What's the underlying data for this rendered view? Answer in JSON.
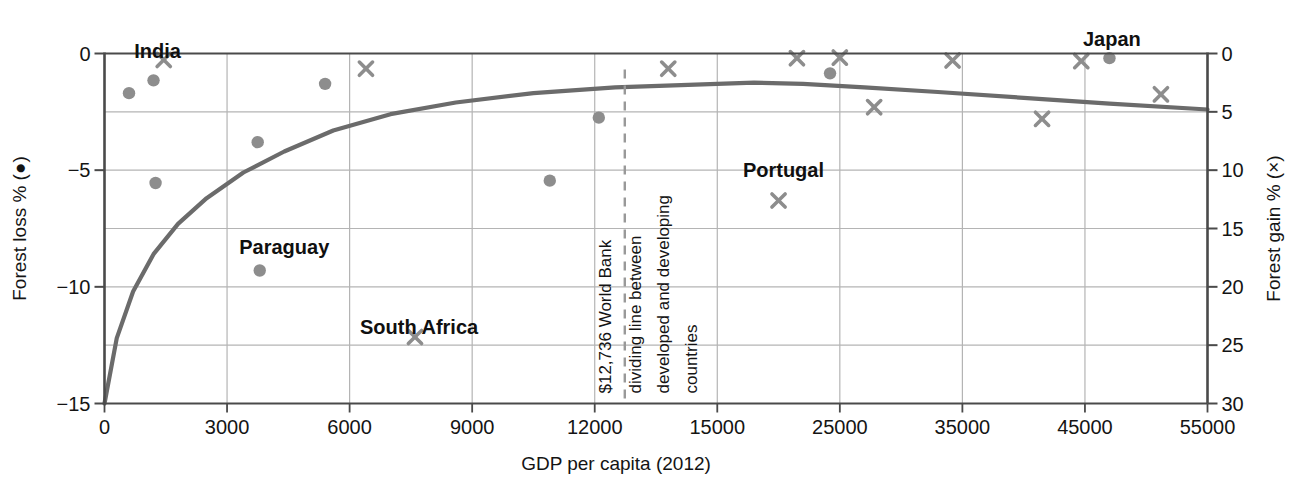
{
  "chart_data": {
    "type": "scatter",
    "title": "",
    "xlabel": "GDP per capita (2012)",
    "ylabel_left": "Forest loss % (●)",
    "ylabel_right": "Forest gain % (×)",
    "xticks": [
      "0",
      "3000",
      "6000",
      "9000",
      "12000",
      "15000",
      "25000",
      "35000",
      "45000",
      "55000"
    ],
    "xtick_values": [
      0,
      3000,
      6000,
      9000,
      12000,
      15000,
      25000,
      35000,
      45000,
      55000
    ],
    "yticks_left": [
      "0",
      "−5",
      "−10",
      "−15"
    ],
    "ytick_values_left": [
      0,
      -5,
      -10,
      -15
    ],
    "yticks_right": [
      "0",
      "5",
      "10",
      "15",
      "20",
      "25",
      "30"
    ],
    "ytick_values_right": [
      0,
      5,
      10,
      15,
      20,
      25,
      30
    ],
    "ylim_left": [
      -15,
      0
    ],
    "ylim_right": [
      30,
      0
    ],
    "grid": true,
    "legend_position": "axis-labels",
    "series": [
      {
        "name": "Forest loss % (●)",
        "marker": "circle",
        "axis": "left",
        "color": "#8d8d8d",
        "points": [
          {
            "x": 600,
            "y": -1.7
          },
          {
            "x": 1200,
            "y": -1.15,
            "label": "India"
          },
          {
            "x": 3750,
            "y": -3.8
          },
          {
            "x": 1250,
            "y": -5.55
          },
          {
            "x": 5400,
            "y": -1.3
          },
          {
            "x": 3800,
            "y": -9.3,
            "label": "Paraguay"
          },
          {
            "x": 12100,
            "y": -2.75
          },
          {
            "x": 10900,
            "y": -5.45
          },
          {
            "x": 24200,
            "y": -0.85
          },
          {
            "x": 47000,
            "y": -0.2,
            "label": "Japan"
          }
        ]
      },
      {
        "name": "Forest gain % (×)",
        "marker": "cross",
        "axis": "right",
        "color": "#8d8d8d",
        "points": [
          {
            "x": 1450,
            "y": 0.55,
            "label": "India"
          },
          {
            "x": 6400,
            "y": 1.3
          },
          {
            "x": 7600,
            "y": 24.3,
            "label": "South Africa"
          },
          {
            "x": 13800,
            "y": 1.3
          },
          {
            "x": 21500,
            "y": 0.4
          },
          {
            "x": 20000,
            "y": 12.6,
            "label": "Portugal"
          },
          {
            "x": 25000,
            "y": 0.35
          },
          {
            "x": 27800,
            "y": 4.6
          },
          {
            "x": 34200,
            "y": 0.6
          },
          {
            "x": 41500,
            "y": 5.6
          },
          {
            "x": 44700,
            "y": 0.65
          },
          {
            "x": 51200,
            "y": 3.5
          }
        ]
      }
    ],
    "trend_line": {
      "name": "fitted curve",
      "color": "#6b6b6b",
      "points": [
        {
          "x": 0,
          "y": -15.0
        },
        {
          "x": 300,
          "y": -12.2
        },
        {
          "x": 700,
          "y": -10.2
        },
        {
          "x": 1200,
          "y": -8.6
        },
        {
          "x": 1800,
          "y": -7.3
        },
        {
          "x": 2500,
          "y": -6.2
        },
        {
          "x": 3400,
          "y": -5.1
        },
        {
          "x": 4400,
          "y": -4.2
        },
        {
          "x": 5600,
          "y": -3.3
        },
        {
          "x": 7000,
          "y": -2.6
        },
        {
          "x": 8600,
          "y": -2.1
        },
        {
          "x": 10500,
          "y": -1.7
        },
        {
          "x": 12500,
          "y": -1.45
        },
        {
          "x": 15000,
          "y": -1.3
        },
        {
          "x": 18000,
          "y": -1.25
        },
        {
          "x": 22000,
          "y": -1.3
        },
        {
          "x": 27000,
          "y": -1.45
        },
        {
          "x": 33000,
          "y": -1.65
        },
        {
          "x": 40000,
          "y": -1.9
        },
        {
          "x": 47000,
          "y": -2.15
        },
        {
          "x": 55000,
          "y": -2.4
        }
      ]
    },
    "annotations": [
      {
        "name": "world-bank-divider",
        "x": 12736,
        "style": "dashed-vertical-line",
        "color": "#999999",
        "text_lines": [
          "$12,736 World Bank",
          "dividing line between",
          "developed and developing",
          "countries"
        ]
      }
    ],
    "country_labels": [
      {
        "text": "India",
        "x": 1300,
        "y": -0.2,
        "anchor": "middle"
      },
      {
        "text": "Paraguay",
        "x": 4400,
        "y": -8.6,
        "anchor": "middle"
      },
      {
        "text": "South Africa",
        "x": 7700,
        "y": -12.0,
        "anchor": "middle"
      },
      {
        "text": "Portugal",
        "x": 20400,
        "y": -5.3,
        "anchor": "middle"
      },
      {
        "text": "Japan",
        "x": 47200,
        "y": 0.5,
        "anchor": "middle"
      }
    ]
  },
  "axes": {
    "x_label": "GDP per capita (2012)",
    "y_left_label": "Forest loss % (●)",
    "y_right_label": "Forest gain % (×)"
  },
  "colors": {
    "marker": "#8d8d8d",
    "trend": "#6b6b6b",
    "grid": "#b4b4b4",
    "axis": "#4a4a4a",
    "text": "#141414",
    "divider": "#9a9a9a"
  }
}
